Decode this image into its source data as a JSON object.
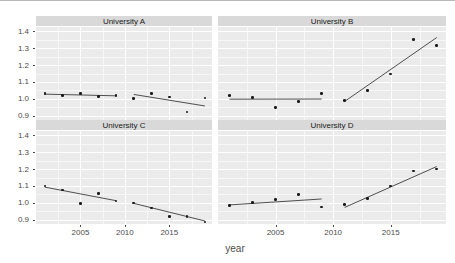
{
  "axes": {
    "ylabel": "cum_change_composite",
    "xlabel": "year",
    "yticks": [
      "1.4",
      "1.3",
      "1.2",
      "1.1",
      "1.0",
      "0.9"
    ],
    "xticks": [
      "2005",
      "2010",
      "2015"
    ]
  },
  "panels": {
    "a": {
      "title": "University A"
    },
    "b": {
      "title": "University B"
    },
    "c": {
      "title": "University C"
    },
    "d": {
      "title": "University D"
    }
  },
  "chart_data": {
    "type": "scatter",
    "title": "",
    "xlabel": "year",
    "ylabel": "cum_change_composite",
    "xlim": [
      2000.0,
      2019.8
    ],
    "ylim": [
      0.875,
      1.425
    ],
    "ytick_values": [
      1.4,
      1.3,
      1.2,
      1.1,
      1.0,
      0.9
    ],
    "xtick_values": [
      2005,
      2010,
      2015
    ],
    "grid": true,
    "legend": null,
    "facet_layout": "2x2",
    "facets": [
      {
        "name": "University A",
        "points": [
          {
            "x": 2001,
            "y": 1.033
          },
          {
            "x": 2003,
            "y": 1.019
          },
          {
            "x": 2005,
            "y": 1.032
          },
          {
            "x": 2007,
            "y": 1.015
          },
          {
            "x": 2009,
            "y": 1.02
          },
          {
            "x": 2011,
            "y": 1.001
          },
          {
            "x": 2013,
            "y": 1.031
          },
          {
            "x": 2015,
            "y": 1.011
          },
          {
            "x": 2017,
            "y": 0.923
          },
          {
            "x": 2019,
            "y": 1.005
          }
        ],
        "fits": [
          {
            "segment": "pre",
            "x": [
              2001,
              2009
            ],
            "y": [
              1.028,
              1.018
            ]
          },
          {
            "segment": "post",
            "x": [
              2011,
              2019
            ],
            "y": [
              1.026,
              0.958
            ]
          }
        ]
      },
      {
        "name": "University B",
        "points": [
          {
            "x": 2001,
            "y": 1.021
          },
          {
            "x": 2003,
            "y": 1.009
          },
          {
            "x": 2005,
            "y": 0.948
          },
          {
            "x": 2007,
            "y": 0.986
          },
          {
            "x": 2009,
            "y": 1.03
          },
          {
            "x": 2011,
            "y": 0.99
          },
          {
            "x": 2013,
            "y": 1.05
          },
          {
            "x": 2015,
            "y": 1.146
          },
          {
            "x": 2017,
            "y": 1.351
          },
          {
            "x": 2019,
            "y": 1.317
          }
        ],
        "fits": [
          {
            "segment": "pre",
            "x": [
              2001,
              2009
            ],
            "y": [
              0.998,
              0.999
            ]
          },
          {
            "segment": "post",
            "x": [
              2011,
              2019
            ],
            "y": [
              0.985,
              1.363
            ]
          }
        ]
      },
      {
        "name": "University C",
        "points": [
          {
            "x": 2001,
            "y": 1.1
          },
          {
            "x": 2003,
            "y": 1.077
          },
          {
            "x": 2005,
            "y": 0.997
          },
          {
            "x": 2007,
            "y": 1.056
          },
          {
            "x": 2009,
            "y": 1.011
          },
          {
            "x": 2011,
            "y": 1.0
          },
          {
            "x": 2013,
            "y": 0.969
          },
          {
            "x": 2015,
            "y": 0.92
          },
          {
            "x": 2017,
            "y": 0.92
          },
          {
            "x": 2019,
            "y": 0.888
          }
        ],
        "fits": [
          {
            "segment": "pre",
            "x": [
              2001,
              2009
            ],
            "y": [
              1.093,
              1.013
            ]
          },
          {
            "segment": "post",
            "x": [
              2011,
              2019
            ],
            "y": [
              0.997,
              0.893
            ]
          }
        ]
      },
      {
        "name": "University D",
        "points": [
          {
            "x": 2001,
            "y": 0.983
          },
          {
            "x": 2003,
            "y": 1.003
          },
          {
            "x": 2005,
            "y": 1.021
          },
          {
            "x": 2007,
            "y": 1.05
          },
          {
            "x": 2009,
            "y": 0.976
          },
          {
            "x": 2011,
            "y": 0.992
          },
          {
            "x": 2013,
            "y": 1.025
          },
          {
            "x": 2015,
            "y": 1.1
          },
          {
            "x": 2017,
            "y": 1.188
          },
          {
            "x": 2019,
            "y": 1.201
          }
        ],
        "fits": [
          {
            "segment": "pre",
            "x": [
              2001,
              2009
            ],
            "y": [
              0.988,
              1.023
            ]
          },
          {
            "segment": "post",
            "x": [
              2011,
              2019
            ],
            "y": [
              0.973,
              1.215
            ]
          }
        ]
      }
    ]
  }
}
